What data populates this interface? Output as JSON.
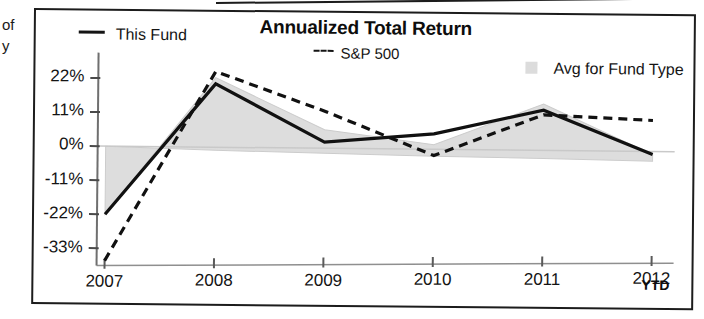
{
  "page_scraps": {
    "line1": "of",
    "line2": "y"
  },
  "chart": {
    "title": "Annualized Total Return",
    "ytd_note": "YTD",
    "legend": [
      {
        "label": "This Fund",
        "marker": "solid-line-marker",
        "color": "#141414"
      },
      {
        "label": "S&P 500",
        "marker": "dashed-line-marker",
        "color": "#141414"
      },
      {
        "label": "Avg for Fund Type",
        "marker": "gray-square-swatch",
        "color": "#dcdcdc"
      }
    ]
  },
  "chart_data": {
    "type": "line",
    "title": "Annualized Total Return",
    "xlabel": "",
    "ylabel": "",
    "categories": [
      "2007",
      "2008",
      "2009",
      "2010",
      "2011",
      "2012"
    ],
    "x_tick_labels": [
      "2007",
      "2008",
      "2009",
      "2010",
      "2011",
      "2012"
    ],
    "y_tick_labels": [
      "22%",
      "11%",
      "0%",
      "-11%",
      "-22%",
      "-33%"
    ],
    "y_tick_values": [
      22,
      11,
      0,
      -11,
      -22,
      -33
    ],
    "ylim": [
      -38,
      27
    ],
    "grid": false,
    "zero_line": true,
    "legend_position": "top",
    "annotations": [
      "YTD"
    ],
    "series": [
      {
        "name": "This Fund",
        "style": "solid",
        "color": "#141414",
        "values": [
          -22,
          20.5,
          2,
          5,
          13,
          -1
        ]
      },
      {
        "name": "S&P 500",
        "style": "dashed",
        "color": "#141414",
        "values": [
          -37,
          24.5,
          12,
          -2,
          11.5,
          10
        ]
      },
      {
        "name": "Avg for Fund Type",
        "style": "filled-area",
        "color": "#dcdcdc",
        "values": [
          -22,
          22.5,
          6,
          1.5,
          15,
          -1
        ],
        "baseline_values": [
          0,
          -1,
          -1.6,
          -2.2,
          -2.6,
          -3.2
        ]
      }
    ]
  }
}
